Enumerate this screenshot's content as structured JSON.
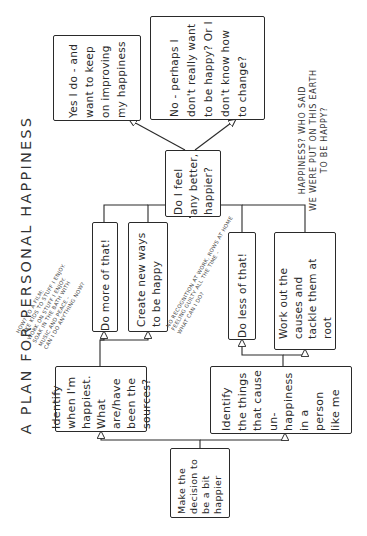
{
  "title": "A PLAN FOR PERSONAL HAPPINESS",
  "nodes": {
    "start": "Make the decision to be a bit happier",
    "identify_happy": "Identify when I'm happiest. What are/have been the sources?",
    "identify_unhappy": "Identify the things that cause un-happiness in a person like me",
    "do_more": "Do more of that!",
    "create_new": "Create new ways to be happy",
    "do_less": "Do less of that!",
    "work_out": "Work out the causes and tackle them at root",
    "check": "Do I feel any better, happier?",
    "yes": "Yes I do - and want to keep on improving my happiness",
    "no": "No - perhaps I don't really want to be happy? Or I don't know how to change?"
  },
  "annotations": {
    "happy_ideas": [
      "How? To a film;",
      "Take kids to stuff I enjoy.",
      "Work on stuff I enjoy.",
      "Soak in the bath with",
      "music and peace -",
      "can I do anything now?"
    ],
    "unhappy_ideas": [
      "No recognition at work, rows at home",
      "feeling guilty all the time -",
      "what can I do?"
    ],
    "quip": [
      "HAPPINESS? WHO SAID",
      "WE WERE PUT ON THIS EARTH",
      "TO BE HAPPY?"
    ]
  },
  "colors": {
    "ink": "#2a2a2a",
    "paper": "#ffffff"
  }
}
